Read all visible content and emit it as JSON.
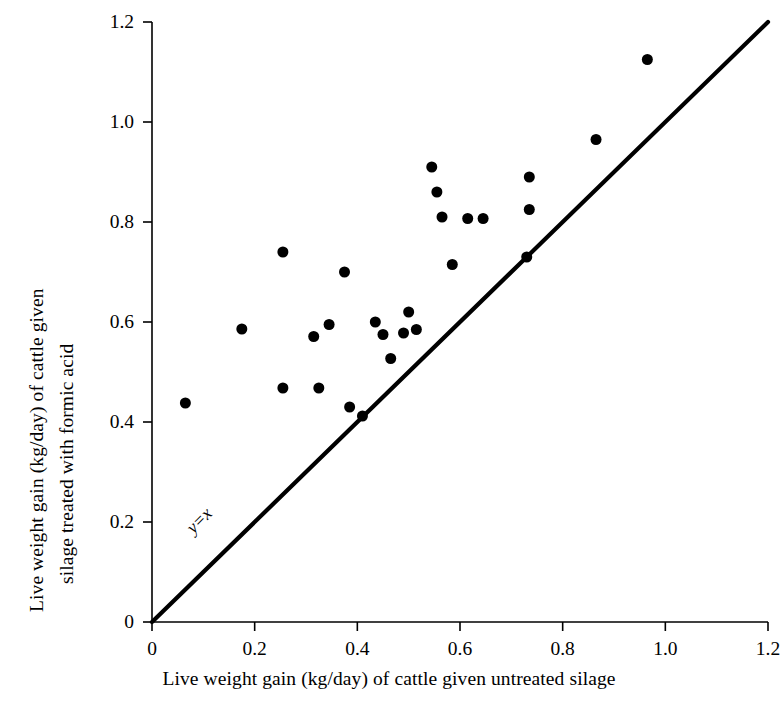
{
  "chart_data": {
    "type": "scatter",
    "title": "",
    "xlabel": "Live weight gain (kg/day) of cattle given untreated silage",
    "ylabel_line1": "Live weight gain (kg/day) of cattle given",
    "ylabel_line2": "silage treated with formic acid",
    "xlim": [
      0,
      1.2
    ],
    "ylim": [
      0,
      1.2
    ],
    "grid": false,
    "legend": "none",
    "xticks": [
      "0",
      "0.2",
      "0.4",
      "0.6",
      "0.8",
      "1.0",
      "1.2"
    ],
    "xtick_values": [
      0,
      0.2,
      0.4,
      0.6,
      0.8,
      1.0,
      1.2
    ],
    "yticks": [
      "0",
      "0.2",
      "0.4",
      "0.6",
      "0.8",
      "1.0",
      "1.2"
    ],
    "ytick_values": [
      0,
      0.2,
      0.4,
      0.6,
      0.8,
      1.0,
      1.2
    ],
    "marker": "filled-circle",
    "marker_color": "#000000",
    "marker_size_px": 11,
    "point_count": 25,
    "x": [
      0.065,
      0.175,
      0.255,
      0.255,
      0.315,
      0.325,
      0.345,
      0.375,
      0.385,
      0.41,
      0.435,
      0.45,
      0.465,
      0.49,
      0.5,
      0.515,
      0.545,
      0.555,
      0.565,
      0.585,
      0.615,
      0.645,
      0.73,
      0.735,
      0.735
    ],
    "y": [
      0.438,
      0.586,
      0.468,
      0.74,
      0.571,
      0.468,
      0.595,
      0.7,
      0.43,
      0.412,
      0.6,
      0.575,
      0.527,
      0.578,
      0.62,
      0.585,
      0.91,
      0.86,
      0.81,
      0.715,
      0.807,
      0.807,
      0.73,
      0.89,
      0.825
    ],
    "points": [
      {
        "x": 0.065,
        "y": 0.438
      },
      {
        "x": 0.175,
        "y": 0.586
      },
      {
        "x": 0.255,
        "y": 0.468
      },
      {
        "x": 0.255,
        "y": 0.74
      },
      {
        "x": 0.315,
        "y": 0.571
      },
      {
        "x": 0.325,
        "y": 0.468
      },
      {
        "x": 0.345,
        "y": 0.595
      },
      {
        "x": 0.375,
        "y": 0.7
      },
      {
        "x": 0.385,
        "y": 0.43
      },
      {
        "x": 0.41,
        "y": 0.412
      },
      {
        "x": 0.435,
        "y": 0.6
      },
      {
        "x": 0.45,
        "y": 0.575
      },
      {
        "x": 0.465,
        "y": 0.527
      },
      {
        "x": 0.49,
        "y": 0.578
      },
      {
        "x": 0.5,
        "y": 0.62
      },
      {
        "x": 0.515,
        "y": 0.585
      },
      {
        "x": 0.545,
        "y": 0.91
      },
      {
        "x": 0.555,
        "y": 0.86
      },
      {
        "x": 0.565,
        "y": 0.81
      },
      {
        "x": 0.585,
        "y": 0.715
      },
      {
        "x": 0.615,
        "y": 0.807
      },
      {
        "x": 0.645,
        "y": 0.807
      },
      {
        "x": 0.73,
        "y": 0.73
      },
      {
        "x": 0.735,
        "y": 0.89
      },
      {
        "x": 0.735,
        "y": 0.825
      },
      {
        "x": 0.865,
        "y": 0.965
      },
      {
        "x": 0.965,
        "y": 1.125
      }
    ],
    "reference_line": {
      "label": "y=x",
      "equation": "y = x",
      "from": [
        0,
        0
      ],
      "to": [
        1.2,
        1.2
      ],
      "color": "#000000",
      "label_x": 0.1,
      "label_y": 0.195
    }
  }
}
